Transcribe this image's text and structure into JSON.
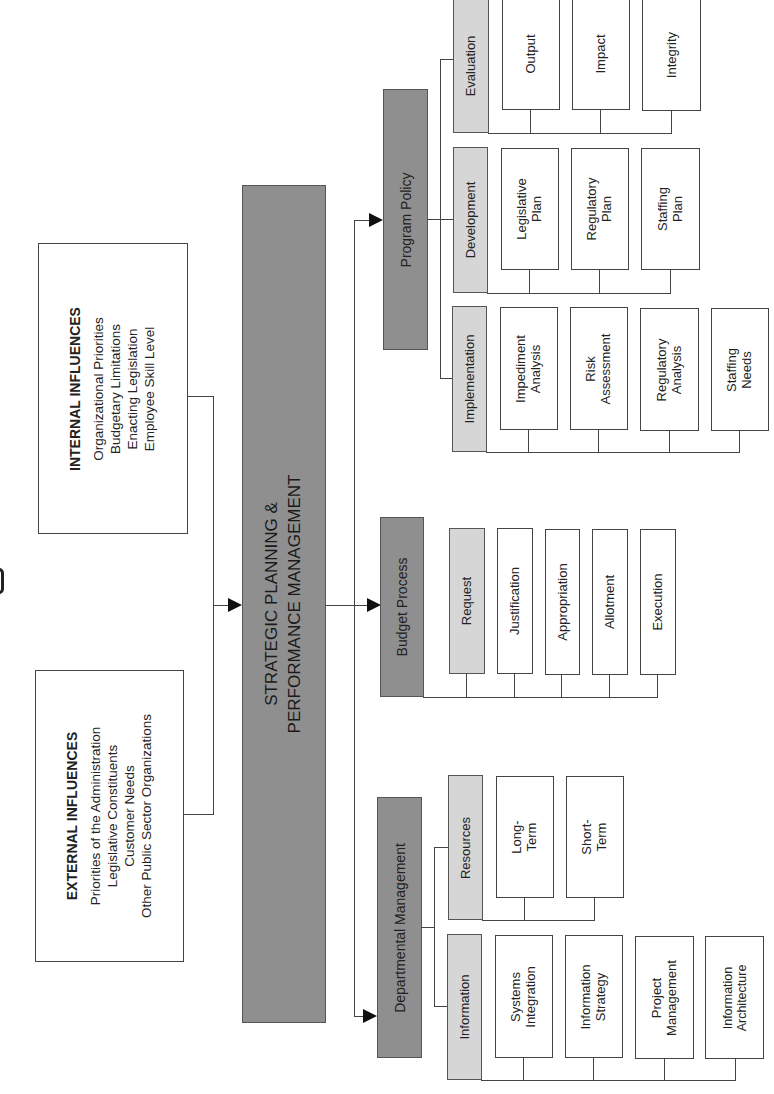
{
  "center": {
    "line1": "STRATEGIC PLANNING &",
    "line2": "PERFORMANCE MANAGEMENT"
  },
  "influences": {
    "internal": {
      "title": "INTERNAL INFLUENCES",
      "items": [
        "Organizational Priorities",
        "Budgetary Limitations",
        "Enacting Legislation",
        "Employee Skill Level"
      ]
    },
    "external": {
      "title": "EXTERNAL INFLUENCES",
      "items": [
        "Priorities of the Administration",
        "Legislative Constituents",
        "Customer Needs",
        "Other Public Sector Organizations"
      ]
    }
  },
  "branches": {
    "program_policy": {
      "label": "Program Policy",
      "groups": [
        {
          "label": "Evaluation",
          "items": [
            "Output",
            "Impact",
            "Integrity"
          ]
        },
        {
          "label": "Development",
          "items": [
            [
              "Legislative",
              "Plan"
            ],
            [
              "Regulatory",
              "Plan"
            ],
            [
              "Staffing",
              "Plan"
            ]
          ]
        },
        {
          "label": "Implementation",
          "items": [
            [
              "Impediment",
              "Analysis"
            ],
            [
              "Risk",
              "Assessment"
            ],
            [
              "Regulatory",
              "Analysis"
            ],
            [
              "Staffing",
              "Needs"
            ]
          ]
        }
      ]
    },
    "budget_process": {
      "label": "Budget Process",
      "items": [
        "Request",
        "Justification",
        "Appropriation",
        "Allotment",
        "Execution"
      ]
    },
    "departmental_management": {
      "label": "Departmental Management",
      "groups": [
        {
          "label": "Resources",
          "items": [
            [
              "Long-",
              "Term"
            ],
            [
              "Short-",
              "Term"
            ]
          ]
        },
        {
          "label": "Information",
          "items": [
            [
              "Systems",
              "Integration"
            ],
            [
              "Information",
              "Strategy"
            ],
            [
              "Project",
              "Management"
            ],
            [
              "Information",
              "Architecture"
            ]
          ]
        }
      ]
    }
  },
  "colors": {
    "primary_box": "#8f8f8f",
    "secondary_box": "#d6d6d6",
    "leaf_box": "#ffffff",
    "line": "#444444"
  }
}
